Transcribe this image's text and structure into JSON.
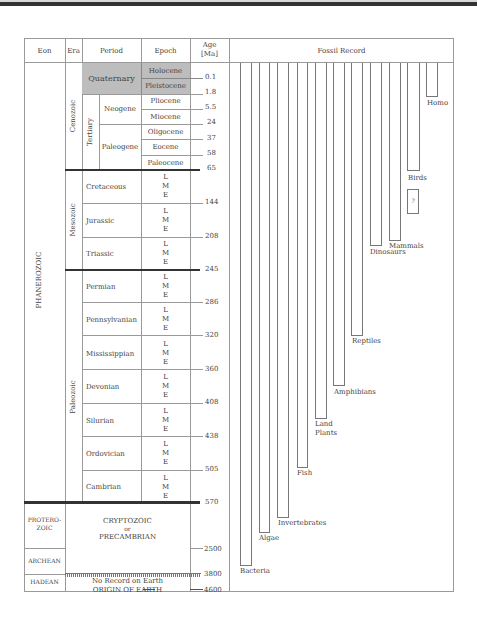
{
  "header": {
    "eon": "Eon",
    "era": "Era",
    "period": "Period",
    "epoch": "Epoch",
    "age_line1": "Age",
    "age_line2": "[Ma]",
    "fossil_record": "Fossil Record"
  },
  "eons": {
    "phanerozoic": "PHANEROZOIC",
    "proterozoic_line1": "PROTERO-",
    "proterozoic_line2": "ZOIC",
    "archean": "ARCHEAN",
    "hadean": "HADEAN"
  },
  "eras": {
    "cenozoic": "Cenozoic",
    "mesozoic": "Mesozoic",
    "paleozoic": "Paleozoic",
    "tertiary": "Tertiary"
  },
  "periods": {
    "quaternary": "Quaternary",
    "neogene": "Neogene",
    "paleogene": "Paleogene",
    "cretaceous": "Cretaceous",
    "jurassic": "Jurassic",
    "triassic": "Triassic",
    "permian": "Permian",
    "pennsylvanian": "Pennsylvanian",
    "mississippian": "Mississippian",
    "devonian": "Devonian",
    "silurian": "Silurian",
    "ordovician": "Ordovician",
    "cambrian": "Cambrian"
  },
  "epochs": {
    "holocene": "Holocene",
    "pleistocene": "Pleistocene",
    "pliocene": "Pliocene",
    "miocene": "Miocene",
    "oligocene": "Oligocene",
    "eocene": "Eocene",
    "paleocene": "Paleocene",
    "lme_l": "L",
    "lme_m": "M",
    "lme_e": "E"
  },
  "precambrian": {
    "line1": "CRYPTOZOIC",
    "line2": "or",
    "line3": "PRECAMBRIAN",
    "no_record": "No Record on Earth",
    "origin": "ORIGIN OF EARTH"
  },
  "ages": [
    "0.1",
    "1.8",
    "5.5",
    "24",
    "37",
    "58",
    "65",
    "144",
    "208",
    "245",
    "286",
    "320",
    "360",
    "408",
    "438",
    "505",
    "570",
    "2500",
    "3800",
    "4600"
  ],
  "fossils": {
    "bacteria": "Bacteria",
    "algae": "Algae",
    "invertebrates": "Invertebrates",
    "fish": "Fish",
    "land_plants_line1": "Land",
    "land_plants_line2": "Plants",
    "amphibians": "Amphibians",
    "reptiles": "Reptiles",
    "dinosaurs": "Dinosaurs",
    "mammals": "Mammals",
    "birds": "Birds",
    "homo": "Homo",
    "unknown": "?"
  },
  "colors": {
    "shade": "#bdbdbd",
    "line": "#9a9a9a",
    "thick": "#333333"
  }
}
